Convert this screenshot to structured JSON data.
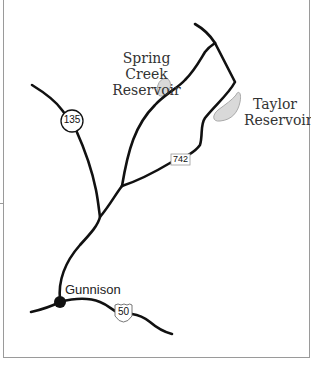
{
  "map": {
    "places": [
      {
        "name": "Gunnison",
        "type": "town"
      },
      {
        "name": "Spring Creek Reservoir",
        "type": "reservoir",
        "lines": [
          "Spring Creek",
          "Reservoir"
        ]
      },
      {
        "name": "Taylor Reservoir",
        "type": "reservoir",
        "lines": [
          "Taylor",
          "Reservoir"
        ]
      }
    ],
    "routes": [
      {
        "number": "135",
        "shield": "state-circle"
      },
      {
        "number": "742",
        "shield": "county-rectangle"
      },
      {
        "number": "50",
        "shield": "us-highway"
      }
    ],
    "colors": {
      "road": "#111111",
      "water_fill": "#d9d9d9",
      "water_stroke": "#aaaaaa",
      "frame": "#9a9a9a",
      "background": "#ffffff"
    }
  }
}
